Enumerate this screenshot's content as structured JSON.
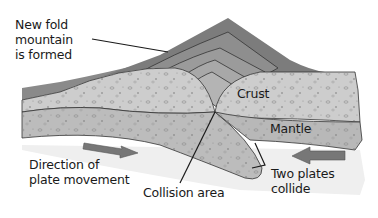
{
  "diagram": {
    "labels": {
      "new_mountain": [
        "New fold",
        "mountain",
        "is formed"
      ],
      "crust": "Crust",
      "mantle": "Mantle",
      "direction": [
        "Direction of",
        "plate movement"
      ],
      "collision": "Collision area",
      "collide": [
        "Two plates",
        "collide"
      ]
    },
    "arrows": [
      {
        "name": "right-arrow",
        "direction": "right"
      },
      {
        "name": "left-arrow",
        "direction": "left"
      }
    ],
    "colors": {
      "mountain_dark": "#7a7a7a",
      "mountain_mid": "#9a9a9a",
      "crust": "#c8c8c8",
      "mantle": "#b4b4b4",
      "background_mantle": "#eeeeee",
      "arrow": "#777777",
      "line": "#1a1a1a"
    }
  }
}
